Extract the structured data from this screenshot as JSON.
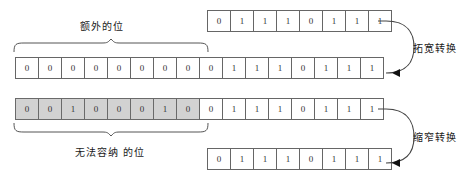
{
  "diagram": {
    "colors": {
      "cell_border": "#666666",
      "cell_fill": "#ffffff",
      "shaded_fill": "#d2d2d2",
      "stroke": "#444444",
      "text": "#1a1a1a"
    },
    "rows": [
      {
        "id": "source",
        "name": "widening-source-row",
        "bits": [
          "0",
          "1",
          "1",
          "1",
          "0",
          "1",
          "1",
          "1"
        ],
        "shaded": [
          false,
          false,
          false,
          false,
          false,
          false,
          false,
          false
        ]
      },
      {
        "id": "widened",
        "name": "widening-result-row",
        "bits": [
          "0",
          "0",
          "0",
          "0",
          "0",
          "0",
          "0",
          "0",
          "0",
          "1",
          "1",
          "1",
          "0",
          "1",
          "1",
          "1"
        ],
        "shaded": [
          false,
          false,
          false,
          false,
          false,
          false,
          false,
          false,
          false,
          false,
          false,
          false,
          false,
          false,
          false,
          false
        ]
      },
      {
        "id": "narrow-source",
        "name": "narrowing-source-row",
        "bits": [
          "0",
          "0",
          "1",
          "0",
          "0",
          "0",
          "1",
          "0",
          "0",
          "1",
          "1",
          "1",
          "0",
          "1",
          "1",
          "1"
        ],
        "shaded": [
          true,
          true,
          true,
          true,
          true,
          true,
          true,
          true,
          false,
          false,
          false,
          false,
          false,
          false,
          false,
          false
        ]
      },
      {
        "id": "narrow-result",
        "name": "narrowing-result-row",
        "bits": [
          "0",
          "1",
          "1",
          "1",
          "0",
          "1",
          "1",
          "1"
        ],
        "shaded": [
          false,
          false,
          false,
          false,
          false,
          false,
          false,
          false
        ]
      }
    ],
    "labels": {
      "extra_bits": "额外的位",
      "lost_bits": "无法容纳\n的位",
      "widening": "拓宽转换",
      "narrowing": "缩窄转换"
    }
  }
}
